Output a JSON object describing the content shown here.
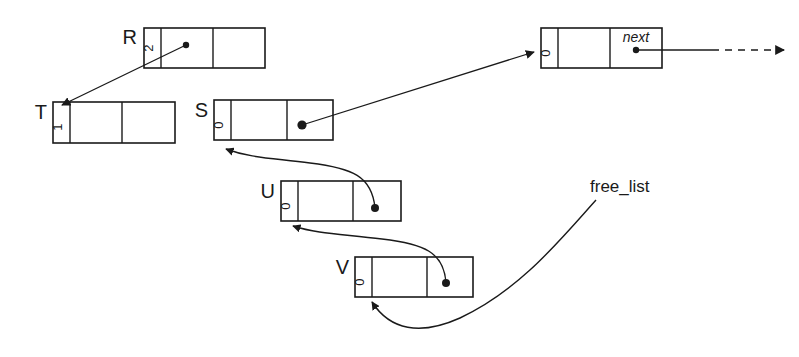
{
  "diagram": {
    "stroke_color": "#1a1a1a",
    "background": "#ffffff",
    "nodes": [
      {
        "id": "R",
        "label": "R",
        "refcount": "2",
        "x": 144,
        "y": 28,
        "w": 121,
        "h": 40,
        "cells": [
          "refcount",
          "pointer",
          "empty"
        ],
        "pointer_cell": 1,
        "next_label": ""
      },
      {
        "id": "T",
        "label": "T",
        "refcount": "1",
        "x": 53,
        "y": 102,
        "w": 122,
        "h": 41,
        "cells": [
          "refcount",
          "empty",
          "empty"
        ],
        "pointer_cell": -1,
        "next_label": ""
      },
      {
        "id": "S",
        "label": "S",
        "refcount": "0",
        "x": 214,
        "y": 100,
        "w": 119,
        "h": 40,
        "cells": [
          "refcount",
          "empty",
          "pointer"
        ],
        "pointer_cell": 2,
        "next_label": ""
      },
      {
        "id": "HEAD",
        "label": "",
        "refcount": "0",
        "x": 541,
        "y": 28,
        "w": 121,
        "h": 40,
        "cells": [
          "refcount",
          "empty",
          "pointer"
        ],
        "pointer_cell": 2,
        "next_label": "next"
      },
      {
        "id": "U",
        "label": "U",
        "refcount": "0",
        "x": 281,
        "y": 181,
        "w": 120,
        "h": 40,
        "cells": [
          "refcount",
          "empty",
          "pointer"
        ],
        "pointer_cell": 2,
        "next_label": ""
      },
      {
        "id": "V",
        "label": "V",
        "refcount": "0",
        "x": 355,
        "y": 257,
        "w": 118,
        "h": 40,
        "cells": [
          "refcount",
          "empty",
          "pointer"
        ],
        "pointer_cell": 2,
        "next_label": ""
      }
    ],
    "free_list": {
      "label": "free_list",
      "label_x": 590,
      "label_y": 190
    },
    "edges": [
      {
        "name": "r-to-t",
        "from": "R",
        "to": "T",
        "style": "straight",
        "arrow": true
      },
      {
        "name": "s-to-head",
        "from": "S",
        "to": "HEAD",
        "style": "straight",
        "arrow": true
      },
      {
        "name": "head-to-right",
        "from": "HEAD",
        "to": "",
        "style": "dashed",
        "arrow": true
      },
      {
        "name": "u-to-s",
        "from": "U",
        "to": "S",
        "style": "curve",
        "arrow": true
      },
      {
        "name": "v-to-u",
        "from": "V",
        "to": "U",
        "style": "curve",
        "arrow": true
      },
      {
        "name": "freelist-to-v",
        "from": "free_list",
        "to": "V",
        "style": "curve",
        "arrow": true
      }
    ]
  }
}
